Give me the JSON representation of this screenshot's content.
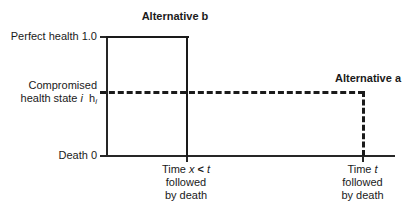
{
  "chart_data": {
    "type": "line",
    "title": "",
    "xlabel": "Time",
    "ylabel": "Health state",
    "ylim": [
      0,
      1.0
    ],
    "y_ticks": [
      {
        "value": 1.0,
        "label": "Perfect health 1.0"
      },
      {
        "value": 0.52,
        "label": "Compromised health state i  h_i"
      },
      {
        "value": 0,
        "label": "Death 0"
      }
    ],
    "x_ticks": [
      {
        "value": "x",
        "label": "Time x < t"
      },
      {
        "value": "t",
        "label": "Time t"
      }
    ],
    "grid": false,
    "legend": "inline-annotation",
    "series": [
      {
        "name": "Alternative b",
        "style": "solid",
        "description": "Perfect health 1.0 maintained until time x, then death",
        "points": [
          {
            "x": 0,
            "y": 1.0
          },
          {
            "x": "x",
            "y": 1.0
          },
          {
            "x": "x",
            "y": 0
          }
        ]
      },
      {
        "name": "Alternative a",
        "style": "dashed",
        "description": "Compromised health state h_i maintained until time t, then death",
        "points": [
          {
            "x": 0,
            "y": 0.52
          },
          {
            "x": "t",
            "y": 0.52
          },
          {
            "x": "t",
            "y": 0
          }
        ]
      }
    ]
  },
  "annotations": {
    "alternative_b_title": "Alternative b",
    "alternative_a_title": "Alternative a"
  },
  "y_axis": {
    "perfect_health": "Perfect health 1.0",
    "compromised_line1": "Compromised",
    "compromised_line2_prefix": "health state ",
    "compromised_state_index": "i",
    "compromised_h": "h",
    "compromised_h_subscript": "i",
    "death": "Death 0"
  },
  "x_axis": {
    "mid_time_prefix": "Time ",
    "mid_time_var": "x",
    "mid_time_operator": " < ",
    "mid_time_limit": "t",
    "mid_followed": "followed",
    "mid_by_death": "by death",
    "right_time_prefix": "Time ",
    "right_time_var": "t",
    "right_followed": "followed",
    "right_by_death": "by death"
  },
  "colors": {
    "background": "#ffffff",
    "axis": "#262626",
    "curve": "#1a1a1a",
    "text": "#1a1a1a"
  }
}
